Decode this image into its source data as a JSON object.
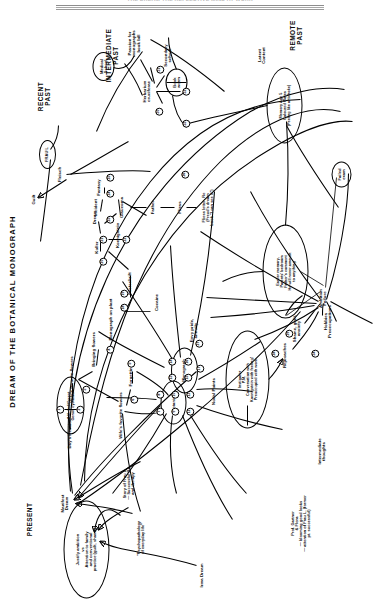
{
  "header": {
    "running_head": "THE DREAM THE REFLECTIVE MIND AT WORK",
    "title": "DREAM OF THE BOTANICAL MONOGRAPH"
  },
  "eras": [
    {
      "label": "PRESENT",
      "x": 92,
      "y": 30
    },
    {
      "label": "RECENT\nPAST",
      "x": 515,
      "y": 44
    },
    {
      "label": "INTERMEDIATE\nPAST",
      "x": 556,
      "y": 112
    },
    {
      "label": "REMOTE\nPAST",
      "x": 576,
      "y": 296
    }
  ],
  "side_labels": [
    {
      "label": "Latent\nContent",
      "x": 556,
      "y": 262
    },
    {
      "label": "Intermediate\nthoughts",
      "x": 160,
      "y": 322
    }
  ],
  "ovals": [
    {
      "id": "ambition",
      "text": "Justify ambition\nvs\nAttention to family\nand conventional\npractice (guilt, shame)",
      "x": 62,
      "y": 86,
      "w": 96,
      "h": 44
    },
    {
      "id": "instigator",
      "text": "Instigator\nP.M.\nConversation with\nKoenigstein with feeling!\nPreoccupied with work",
      "x": 232,
      "y": 247,
      "w": 96,
      "h": 42
    },
    {
      "id": "earlier-memory",
      "text": "Earlier memory,\nParents' bedroom\nFather's comment\nHe will never amount\nto anything",
      "x": 340,
      "y": 285,
      "w": 92,
      "h": 44
    },
    {
      "id": "coloured-plates",
      "text": "Memory Age 5\nColoured Plates\n(Peeling like artichoke)",
      "x": 506,
      "y": 284,
      "w": 74,
      "h": 34
    },
    {
      "id": "botanical",
      "text": "Botanical",
      "x": 209,
      "y": 173,
      "w": 42,
      "h": 24
    },
    {
      "id": "monograph",
      "text": "Monograph",
      "x": 241,
      "y": 184,
      "w": 44,
      "h": 25
    },
    {
      "id": "days-residue",
      "text": "A&L Indifferent\nGenus cyclamen",
      "x": 206,
      "y": 70,
      "w": 56,
      "h": 26
    },
    {
      "id": "bookworm",
      "text": "Book\nworm",
      "x": 529,
      "y": 176,
      "w": 26,
      "h": 20
    },
    {
      "id": "medical-school",
      "text": "Medical\nSchool",
      "x": 545,
      "y": 103,
      "w": 27,
      "h": 20
    },
    {
      "id": "failed-exam",
      "text": "Failed\nexam",
      "x": 437,
      "y": 341,
      "w": 24,
      "h": 18
    },
    {
      "id": "frau-l",
      "text": "FRAU L",
      "x": 457,
      "y": 47,
      "w": 27,
      "h": 15
    }
  ],
  "nodes": [
    {
      "id": "irma-dream",
      "text": "Irma Dream",
      "x": 36,
      "y": 202,
      "rot": 0,
      "cls": "nd"
    },
    {
      "id": "manifest-dream",
      "text": "Manifest\nDream",
      "x": 108,
      "y": 65,
      "rot": 0,
      "cls": "nd"
    },
    {
      "id": "psychopathology",
      "text": "\"Psychopathology\nof everyday life\"",
      "x": 73,
      "y": 140,
      "rot": 0,
      "cls": "nd s"
    },
    {
      "id": "story-frau-l",
      "text": "Story of Frau L.\n— Successful Rx\nand therapy",
      "x": 128,
      "y": 128,
      "rot": 0,
      "cls": "nd s"
    },
    {
      "id": "prof-gartner",
      "text": "Prof. Gartner\n& Flora\n— blooming good looks\n— attention of Frau L. (former\npt. successful)",
      "x": 88,
      "y": 300,
      "rot": 0,
      "cls": "nd s"
    },
    {
      "id": "days-residue-lbl",
      "text": "Day's Residue",
      "x": 178,
      "y": 70,
      "rot": 0,
      "cls": "nd"
    },
    {
      "id": "wifes-fav-flowers",
      "text": "Wife's favorite flowers",
      "x": 232,
      "y": 72,
      "rot": 0,
      "cls": "nd"
    },
    {
      "id": "bringing-flowers",
      "text": "Bringing flowers",
      "x": 262,
      "y": 94,
      "rot": 0,
      "cls": "nd"
    },
    {
      "id": "wifes-fav-flowers2",
      "text": "Wife's favorite flowers",
      "x": 196,
      "y": 121,
      "rot": 0,
      "cls": "nd"
    },
    {
      "id": "forgetting",
      "text": "Forgetting",
      "x": 236,
      "y": 131,
      "rot": 0,
      "cls": "nd"
    },
    {
      "id": "nodal-points",
      "text": "Nodal Points",
      "x": 220,
      "y": 214,
      "rot": 0,
      "cls": "nd"
    },
    {
      "id": "monograph-on-plant",
      "text": "Monograph on plant",
      "x": 292,
      "y": 111,
      "rot": 0,
      "cls": "nd"
    },
    {
      "id": "cocaine",
      "text": "Cocaine",
      "x": 309,
      "y": 157,
      "rot": 0,
      "cls": "nd"
    },
    {
      "id": "festschrift",
      "text": "Festschrift",
      "x": 328,
      "y": 130,
      "rot": 0,
      "cls": "nd"
    },
    {
      "id": "koller",
      "text": "Koller",
      "x": 364,
      "y": 97,
      "rot": 0,
      "cls": "nd"
    },
    {
      "id": "koenigstein",
      "text": "Koenigstein",
      "x": 376,
      "y": 118,
      "rot": 0,
      "cls": "nd"
    },
    {
      "id": "dream-n",
      "text": "Dream",
      "x": 394,
      "y": 95,
      "rot": 0,
      "cls": "nd"
    },
    {
      "id": "glaucoma",
      "text": "Glaucoma",
      "x": 404,
      "y": 122,
      "rot": 0,
      "cls": "nd"
    },
    {
      "id": "incident",
      "text": "Incident",
      "x": 404,
      "y": 96,
      "rot": 0,
      "cls": "nd"
    },
    {
      "id": "fantasy",
      "text": "Fantasy",
      "x": 424,
      "y": 99,
      "rot": 0,
      "cls": "nd"
    },
    {
      "id": "father",
      "text": "Father",
      "x": 404,
      "y": 153,
      "rot": 0,
      "cls": "nd"
    },
    {
      "id": "fliess",
      "text": "Fliess",
      "x": 404,
      "y": 180,
      "rot": 0,
      "cls": "nd"
    },
    {
      "id": "fliess-letter",
      "text": "Fliess letter- Re\n(Freud's dream\nbook \"I can see it\")",
      "x": 404,
      "y": 207,
      "rot": 0,
      "cls": "nd s"
    },
    {
      "id": "fleisch",
      "text": "Fleisch",
      "x": 437,
      "y": 60,
      "rot": 0,
      "cls": "nd"
    },
    {
      "id": "guilt",
      "text": "Guilt",
      "x": 412,
      "y": 34,
      "rot": 0,
      "cls": "nd"
    },
    {
      "id": "ambition-failure",
      "text": "Ambition\nFailure",
      "x": 313,
      "y": 323,
      "rot": 0,
      "cls": "nd"
    },
    {
      "id": "shame-guilt",
      "text": "Shame, guilt,\nanxiety",
      "x": 283,
      "y": 297,
      "rot": 0,
      "cls": "nd"
    },
    {
      "id": "reproaches",
      "text": "Reproaches",
      "x": 256,
      "y": 285,
      "rot": 0,
      "cls": "nd"
    },
    {
      "id": "hobbies",
      "text": "Hobbies\nPreoccupations",
      "x": 290,
      "y": 328,
      "rot": 0,
      "cls": "nd"
    },
    {
      "id": "envy-pride",
      "text": "Envy pride,\nannuity",
      "x": 281,
      "y": 194,
      "rot": 0,
      "cls": "nd"
    },
    {
      "id": "passion-monographs",
      "text": "Passion for\nmonographs\nbook bill",
      "x": 568,
      "y": 134,
      "rot": 0,
      "cls": "nd"
    },
    {
      "id": "herbarium",
      "text": "Herbarium\ncruciferae",
      "x": 520,
      "y": 147,
      "rot": 0,
      "cls": "nd"
    },
    {
      "id": "secondary-school",
      "text": "Secondary\nschool",
      "x": 556,
      "y": 168,
      "rot": 0,
      "cls": "nd"
    }
  ],
  "circled_numbers": [
    {
      "n": "1",
      "x": 202,
      "y": 60
    },
    {
      "n": "2",
      "x": 202,
      "y": 80
    },
    {
      "n": "3",
      "x": 222,
      "y": 86
    },
    {
      "n": "4",
      "x": 262,
      "y": 110
    },
    {
      "n": "5",
      "x": 248,
      "y": 131
    },
    {
      "n": "6",
      "x": 212,
      "y": 134
    },
    {
      "n": "7",
      "x": 200,
      "y": 160
    },
    {
      "n": "8",
      "x": 217,
      "y": 160
    },
    {
      "n": "9",
      "x": 200,
      "y": 175
    },
    {
      "n": "10",
      "x": 217,
      "y": 175
    },
    {
      "n": "11",
      "x": 200,
      "y": 190
    },
    {
      "n": "12",
      "x": 217,
      "y": 190
    },
    {
      "n": "13",
      "x": 234,
      "y": 172
    },
    {
      "n": "14",
      "x": 250,
      "y": 172
    },
    {
      "n": "15",
      "x": 234,
      "y": 188
    },
    {
      "n": "16",
      "x": 250,
      "y": 188
    },
    {
      "n": "17",
      "x": 243,
      "y": 200
    },
    {
      "n": "18",
      "x": 304,
      "y": 124
    },
    {
      "n": "19",
      "x": 318,
      "y": 124
    },
    {
      "n": "20",
      "x": 350,
      "y": 103
    },
    {
      "n": "21",
      "x": 372,
      "y": 103
    },
    {
      "n": "22",
      "x": 372,
      "y": 126
    },
    {
      "n": "23",
      "x": 392,
      "y": 110
    },
    {
      "n": "24",
      "x": 418,
      "y": 110
    },
    {
      "n": "25",
      "x": 434,
      "y": 110
    },
    {
      "n": "26",
      "x": 437,
      "y": 185
    },
    {
      "n": "27",
      "x": 268,
      "y": 199
    },
    {
      "n": "28",
      "x": 258,
      "y": 275
    },
    {
      "n": "29",
      "x": 278,
      "y": 289
    },
    {
      "n": "30",
      "x": 500,
      "y": 159
    },
    {
      "n": "31",
      "x": 542,
      "y": 160
    },
    {
      "n": "32",
      "x": 520,
      "y": 186
    },
    {
      "n": "33",
      "x": 488,
      "y": 186
    },
    {
      "n": "34",
      "x": 258,
      "y": 315
    }
  ],
  "arrows": [
    {
      "from": "irma-dream",
      "to": "ambition"
    },
    {
      "from": "psychopathology",
      "to": "ambition"
    },
    {
      "from": "story-frau-l",
      "to": "manifest-dream"
    },
    {
      "from": "instigator",
      "to": "reproaches"
    },
    {
      "from": "ambition-failure",
      "to": "shame-guilt"
    },
    {
      "from": "fleisch",
      "to": "guilt"
    }
  ]
}
